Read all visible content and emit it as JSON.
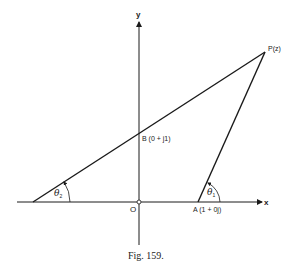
{
  "diagram": {
    "caption": "Fig. 159.",
    "axes": {
      "x_label": "x",
      "y_label": "y",
      "origin_label": "O"
    },
    "points": {
      "P": "P(z)",
      "B": "B (0 + j1)",
      "A": "A (1 + 0j)"
    },
    "angles": {
      "theta1": {
        "symbol": "θ",
        "subscript": "1"
      },
      "theta2": {
        "symbol": "θ",
        "subscript": "2"
      }
    }
  }
}
